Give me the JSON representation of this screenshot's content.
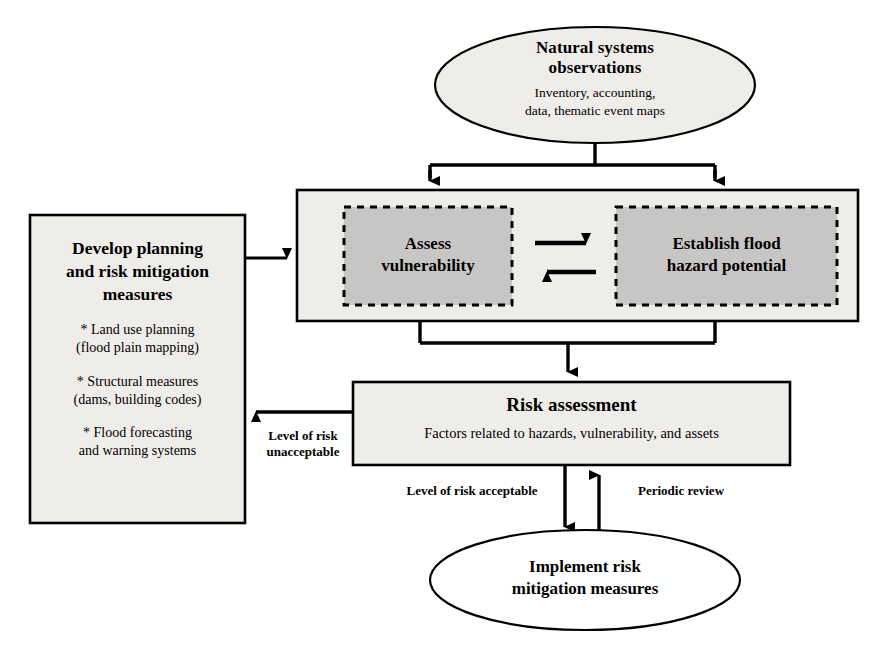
{
  "diagram": {
    "colors": {
      "outline": "#000000",
      "box_fill_light": "#eeece8",
      "inner_fill_gray": "#c6c4c2",
      "page_background": "#ffffff"
    },
    "nodes": {
      "natural_systems": {
        "shape": "ellipse",
        "title": "Natural systems\nobservations",
        "title_line1": "Natural systems",
        "title_line2": "observations",
        "subtitle_line1": "Inventory, accounting,",
        "subtitle_line2": "data, thematic event maps"
      },
      "assessment_container": {
        "shape": "rectangle",
        "inner_left": {
          "line1": "Assess",
          "line2": "vulnerability"
        },
        "inner_right": {
          "line1": "Establish flood",
          "line2": "hazard potential"
        }
      },
      "develop_planning": {
        "shape": "rectangle",
        "title_line1": "Develop planning",
        "title_line2": "and risk mitigation",
        "title_line3": "measures",
        "items": [
          {
            "line1": "* Land use planning",
            "line2": "(flood plain mapping)"
          },
          {
            "line1": "*  Structural measures",
            "line2": "(dams, building codes)"
          },
          {
            "line1": "* Flood forecasting",
            "line2": "and warning systems"
          }
        ]
      },
      "risk_assessment": {
        "shape": "rectangle",
        "title": "Risk assessment",
        "subtitle": "Factors related to hazards, vulnerability, and assets"
      },
      "implement": {
        "shape": "ellipse",
        "title_line1": "Implement risk",
        "title_line2": "mitigation measures"
      }
    },
    "edge_labels": {
      "unacceptable_line1": "Level of risk",
      "unacceptable_line2": "unacceptable",
      "acceptable": "Level of risk acceptable",
      "periodic_review": "Periodic review"
    }
  }
}
